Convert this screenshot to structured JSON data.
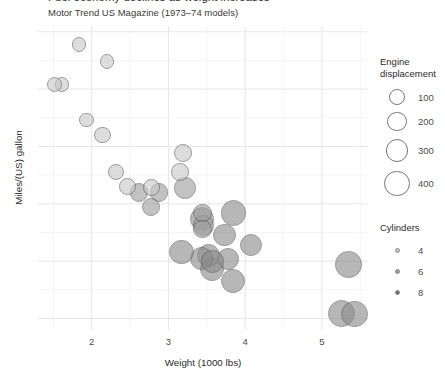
{
  "chart_data": {
    "type": "scatter",
    "title": "Fuel economy declines as weight increases",
    "subtitle": "Motor Trend US Magazine (1973–74 models)",
    "xlabel": "Weight (1000 lbs)",
    "ylabel": "Miles/(US) gallon",
    "xlim": [
      1.3,
      5.6
    ],
    "ylim": [
      9.0,
      35.5
    ],
    "xticks": [
      2,
      3,
      4,
      5
    ],
    "yticks": [
      35,
      30,
      25,
      20,
      15,
      10
    ],
    "grid": true,
    "legend_position": "right",
    "size_legend": {
      "title": "Engine\ndisplacement",
      "values": [
        100,
        200,
        300,
        400
      ]
    },
    "color_legend": {
      "title": "Cylinders",
      "values": [
        4,
        6,
        8
      ],
      "colors": [
        "#c9c9c9",
        "#9b9b9b",
        "#6e6e6e"
      ]
    },
    "point_color": "#8a8a8a",
    "point_stroke": "#5a5a5a",
    "points": [
      {
        "name": "Mazda RX4",
        "wt": 2.62,
        "mpg": 21.0,
        "disp": 160.0,
        "cyl": 6
      },
      {
        "name": "Mazda RX4 Wag",
        "wt": 2.875,
        "mpg": 21.0,
        "disp": 160.0,
        "cyl": 6
      },
      {
        "name": "Datsun 710",
        "wt": 2.32,
        "mpg": 22.8,
        "disp": 108.0,
        "cyl": 4
      },
      {
        "name": "Hornet 4 Drive",
        "wt": 3.215,
        "mpg": 21.4,
        "disp": 258.0,
        "cyl": 6
      },
      {
        "name": "Hornet Sportabout",
        "wt": 3.44,
        "mpg": 18.7,
        "disp": 360.0,
        "cyl": 8
      },
      {
        "name": "Valiant",
        "wt": 3.46,
        "mpg": 18.1,
        "disp": 225.0,
        "cyl": 6
      },
      {
        "name": "Duster 360",
        "wt": 3.57,
        "mpg": 14.3,
        "disp": 360.0,
        "cyl": 8
      },
      {
        "name": "Merc 240D",
        "wt": 3.19,
        "mpg": 24.4,
        "disp": 146.7,
        "cyl": 4
      },
      {
        "name": "Merc 230",
        "wt": 3.15,
        "mpg": 22.8,
        "disp": 140.8,
        "cyl": 4
      },
      {
        "name": "Merc 280",
        "wt": 3.44,
        "mpg": 19.2,
        "disp": 167.6,
        "cyl": 6
      },
      {
        "name": "Merc 280C",
        "wt": 3.44,
        "mpg": 17.8,
        "disp": 167.6,
        "cyl": 6
      },
      {
        "name": "Merc 450SE",
        "wt": 4.07,
        "mpg": 16.4,
        "disp": 275.8,
        "cyl": 8
      },
      {
        "name": "Merc 450SL",
        "wt": 3.73,
        "mpg": 17.3,
        "disp": 275.8,
        "cyl": 8
      },
      {
        "name": "Merc 450SLC",
        "wt": 3.78,
        "mpg": 15.2,
        "disp": 275.8,
        "cyl": 8
      },
      {
        "name": "Cadillac Fleetwood",
        "wt": 5.25,
        "mpg": 10.4,
        "disp": 472.0,
        "cyl": 8
      },
      {
        "name": "Lincoln Continental",
        "wt": 5.424,
        "mpg": 10.4,
        "disp": 460.0,
        "cyl": 8
      },
      {
        "name": "Chrysler Imperial",
        "wt": 5.345,
        "mpg": 14.7,
        "disp": 440.0,
        "cyl": 8
      },
      {
        "name": "Fiat 128",
        "wt": 2.2,
        "mpg": 32.4,
        "disp": 78.7,
        "cyl": 4
      },
      {
        "name": "Honda Civic",
        "wt": 1.615,
        "mpg": 30.4,
        "disp": 75.7,
        "cyl": 4
      },
      {
        "name": "Toyota Corolla",
        "wt": 1.835,
        "mpg": 33.9,
        "disp": 71.1,
        "cyl": 4
      },
      {
        "name": "Toyota Corona",
        "wt": 2.465,
        "mpg": 21.5,
        "disp": 120.1,
        "cyl": 4
      },
      {
        "name": "Dodge Challenger",
        "wt": 3.52,
        "mpg": 15.5,
        "disp": 318.0,
        "cyl": 8
      },
      {
        "name": "AMC Javelin",
        "wt": 3.435,
        "mpg": 15.2,
        "disp": 304.0,
        "cyl": 8
      },
      {
        "name": "Camaro Z28",
        "wt": 3.84,
        "mpg": 13.3,
        "disp": 350.0,
        "cyl": 8
      },
      {
        "name": "Pontiac Firebird",
        "wt": 3.845,
        "mpg": 19.2,
        "disp": 400.0,
        "cyl": 8
      },
      {
        "name": "Fiat X1-9",
        "wt": 1.935,
        "mpg": 27.3,
        "disp": 79.0,
        "cyl": 4
      },
      {
        "name": "Porsche 914-2",
        "wt": 2.14,
        "mpg": 26.0,
        "disp": 120.3,
        "cyl": 4
      },
      {
        "name": "Lotus Europa",
        "wt": 1.513,
        "mpg": 30.4,
        "disp": 95.1,
        "cyl": 4
      },
      {
        "name": "Ford Pantera L",
        "wt": 3.17,
        "mpg": 15.8,
        "disp": 351.0,
        "cyl": 8
      },
      {
        "name": "Ferrari Dino",
        "wt": 2.77,
        "mpg": 19.7,
        "disp": 145.0,
        "cyl": 6
      },
      {
        "name": "Maserati Bora",
        "wt": 3.57,
        "mpg": 15.0,
        "disp": 301.0,
        "cyl": 8
      },
      {
        "name": "Volvo 142E",
        "wt": 2.78,
        "mpg": 21.4,
        "disp": 121.0,
        "cyl": 4
      }
    ]
  }
}
